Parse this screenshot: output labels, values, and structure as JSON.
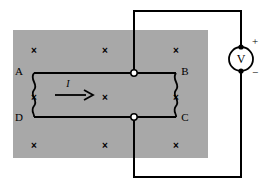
{
  "figure": {
    "background_color": "#ffffff",
    "wire_color": "#000000",
    "field_region": {
      "name": "magnetic-field-region",
      "fill_color": "#a8a8a8",
      "x": 13,
      "y": 30,
      "width": 195,
      "height": 128,
      "field_direction_symbol": "×",
      "field_direction_meaning": "into-page",
      "field_marks": [
        {
          "symbol": "×",
          "x": 34,
          "y": 50
        },
        {
          "symbol": "×",
          "x": 105,
          "y": 50
        },
        {
          "symbol": "×",
          "x": 176,
          "y": 50
        },
        {
          "symbol": "×",
          "x": 34,
          "y": 97
        },
        {
          "symbol": "×",
          "x": 105,
          "y": 97
        },
        {
          "symbol": "×",
          "x": 176,
          "y": 97
        },
        {
          "symbol": "×",
          "x": 34,
          "y": 145
        },
        {
          "symbol": "×",
          "x": 105,
          "y": 145
        },
        {
          "symbol": "×",
          "x": 176,
          "y": 145
        }
      ]
    },
    "loop": {
      "name": "conducting-loop",
      "corner_labels": [
        {
          "id": "corner-a",
          "text": "A",
          "x": 19,
          "y": 75
        },
        {
          "id": "corner-b",
          "text": "B",
          "x": 181,
          "y": 75
        },
        {
          "id": "corner-c",
          "text": "C",
          "x": 181,
          "y": 121
        },
        {
          "id": "corner-d",
          "text": "D",
          "x": 19,
          "y": 121
        }
      ],
      "left_segment_style": "wavy",
      "right_segment_style": "wavy",
      "top_wire_y": 73,
      "bottom_wire_y": 117,
      "left_wire_x": 34,
      "right_wire_x": 176
    },
    "current": {
      "name": "current-arrow",
      "label": "I",
      "label_x": 68,
      "label_y": 83,
      "direction": "right",
      "arrow_start_x": 55,
      "arrow_end_x": 90,
      "arrow_y": 95
    },
    "junction_nodes": [
      {
        "id": "node-top",
        "x": 134,
        "y": 73,
        "style": "hollow"
      },
      {
        "id": "node-bottom",
        "x": 134,
        "y": 117,
        "style": "hollow"
      }
    ],
    "external_circuit": {
      "name": "external-circuit-wire",
      "top_node_x": 134,
      "top_rail_y": 11,
      "bottom_node_x": 134,
      "bottom_rail_y": 177,
      "meter_x": 241
    },
    "voltmeter": {
      "name": "voltmeter",
      "symbol": "V",
      "center_x": 241,
      "center_y": 59,
      "radius": 12,
      "positive_terminal": "+",
      "negative_terminal": "−",
      "positive_x": 256,
      "positive_y": 44,
      "negative_x": 256,
      "negative_y": 79,
      "terminal_dot_top_y": 47,
      "terminal_dot_bottom_y": 71
    }
  }
}
